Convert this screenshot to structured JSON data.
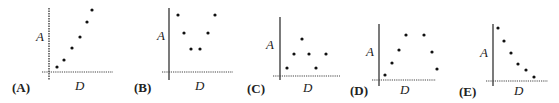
{
  "chart_data": [
    {
      "type": "scatter",
      "panel_label": "(A)",
      "xlabel": "D",
      "ylabel": "A",
      "description": "monotonically increasing",
      "points": [
        [
          1,
          1
        ],
        [
          2,
          2
        ],
        [
          3,
          3.6
        ],
        [
          4,
          5
        ],
        [
          5,
          7
        ],
        [
          5.5,
          8.5
        ]
      ],
      "px": {
        "yaxis_x": 49,
        "yaxis_top": 8,
        "yaxis_bottom": 80,
        "xaxis_y": 72,
        "xaxis_left": 42,
        "xaxis_right": 113,
        "pts": [
          [
            57,
            67
          ],
          [
            64,
            60
          ],
          [
            72,
            48
          ],
          [
            80,
            37
          ],
          [
            87,
            22
          ],
          [
            92,
            10
          ]
        ],
        "ylabel_pos": [
          36,
          41
        ],
        "panel_pos": [
          12,
          92
        ],
        "xlabel_pos": [
          75,
          90
        ]
      }
    },
    {
      "type": "scatter",
      "panel_label": "(B)",
      "xlabel": "D",
      "ylabel": "A",
      "description": "U-shaped (minimum in middle)",
      "points": [
        [
          1,
          7.5
        ],
        [
          2,
          5
        ],
        [
          3,
          3
        ],
        [
          4,
          3
        ],
        [
          5,
          5
        ],
        [
          6,
          7.5
        ]
      ],
      "px": {
        "yaxis_x": 169,
        "yaxis_top": 8,
        "yaxis_bottom": 80,
        "xaxis_y": 72,
        "xaxis_left": 162,
        "xaxis_right": 233,
        "pts": [
          [
            178,
            15
          ],
          [
            184,
            33
          ],
          [
            191,
            49
          ],
          [
            200,
            49
          ],
          [
            208,
            33
          ],
          [
            215,
            15
          ]
        ],
        "ylabel_pos": [
          157,
          40
        ],
        "panel_pos": [
          134,
          92
        ],
        "xlabel_pos": [
          195,
          90
        ]
      }
    },
    {
      "type": "scatter",
      "panel_label": "(C)",
      "xlabel": "D",
      "ylabel": "A",
      "description": "zig-zag / no trend",
      "points": [
        [
          1,
          1
        ],
        [
          2,
          3
        ],
        [
          3,
          5
        ],
        [
          4,
          3
        ],
        [
          5,
          1
        ],
        [
          6,
          3
        ]
      ],
      "px": {
        "yaxis_x": 280,
        "yaxis_top": 17,
        "yaxis_bottom": 80,
        "xaxis_y": 76,
        "xaxis_left": 273,
        "xaxis_right": 340,
        "pts": [
          [
            287,
            68
          ],
          [
            294,
            54
          ],
          [
            302,
            39
          ],
          [
            309,
            54
          ],
          [
            316,
            68
          ],
          [
            326,
            54
          ]
        ],
        "ylabel_pos": [
          266,
          49
        ],
        "panel_pos": [
          247,
          93
        ],
        "xlabel_pos": [
          303,
          92
        ]
      }
    },
    {
      "type": "scatter",
      "panel_label": "(D)",
      "xlabel": "D",
      "ylabel": "A",
      "description": "inverted U (maximum in middle)",
      "points": [
        [
          1,
          1
        ],
        [
          2,
          3
        ],
        [
          3,
          5
        ],
        [
          4,
          7
        ],
        [
          5,
          7
        ],
        [
          6,
          4.5
        ],
        [
          7,
          2
        ]
      ],
      "px": {
        "yaxis_x": 379,
        "yaxis_top": 24,
        "yaxis_bottom": 86,
        "xaxis_y": 80,
        "xaxis_left": 372,
        "xaxis_right": 436,
        "pts": [
          [
            385,
            75
          ],
          [
            392,
            63
          ],
          [
            399,
            50
          ],
          [
            406,
            35
          ],
          [
            424,
            35
          ],
          [
            432,
            52
          ],
          [
            437,
            69
          ]
        ],
        "ylabel_pos": [
          366,
          56
        ],
        "panel_pos": [
          350,
          95
        ],
        "xlabel_pos": [
          400,
          94
        ]
      }
    },
    {
      "type": "scatter",
      "panel_label": "(E)",
      "xlabel": "D",
      "ylabel": "A",
      "description": "monotonically decreasing",
      "points": [
        [
          1,
          8
        ],
        [
          2,
          6.5
        ],
        [
          3,
          4.8
        ],
        [
          4,
          3.2
        ],
        [
          5,
          2.3
        ],
        [
          6,
          1
        ]
      ],
      "px": {
        "yaxis_x": 493,
        "yaxis_top": 24,
        "yaxis_bottom": 86,
        "xaxis_y": 81,
        "xaxis_left": 486,
        "xaxis_right": 548,
        "pts": [
          [
            498,
            28
          ],
          [
            504,
            41
          ],
          [
            511,
            53
          ],
          [
            518,
            64
          ],
          [
            526,
            70
          ],
          [
            534,
            77
          ]
        ],
        "ylabel_pos": [
          480,
          57
        ],
        "panel_pos": [
          459,
          96
        ],
        "xlabel_pos": [
          514,
          95
        ]
      }
    }
  ]
}
